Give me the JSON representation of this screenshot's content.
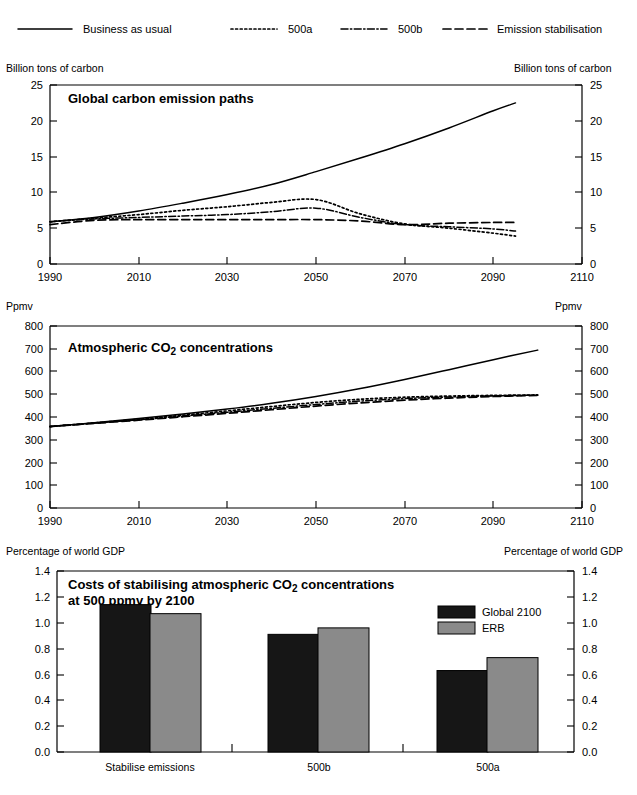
{
  "legend": {
    "items": [
      {
        "label": "Business as usual",
        "style": "solid",
        "key": "bau"
      },
      {
        "label": "500a",
        "style": "dotted",
        "key": "s500a"
      },
      {
        "label": "500b",
        "style": "dash-dot",
        "key": "s500b"
      },
      {
        "label": "Emission stabilisation",
        "style": "dashed",
        "key": "stab"
      }
    ]
  },
  "chart_data": [
    {
      "type": "line",
      "title": "Global carbon emission paths",
      "xlabel": "",
      "ylabel": "Billion tons of carbon",
      "ylabel_right": "Billion tons of carbon",
      "xlim": [
        1990,
        2110
      ],
      "ylim": [
        0,
        25
      ],
      "xticks": [
        1990,
        2010,
        2030,
        2050,
        2070,
        2090,
        2110
      ],
      "yticks": [
        0,
        5,
        10,
        15,
        20,
        25
      ],
      "grid": false,
      "legend_position": "top",
      "x": [
        1990,
        2000,
        2010,
        2020,
        2030,
        2040,
        2050,
        2060,
        2070,
        2080,
        2090,
        2095
      ],
      "series": [
        {
          "name": "Business as usual",
          "values": [
            5.9,
            6.5,
            7.4,
            8.5,
            9.7,
            11.1,
            12.9,
            14.8,
            16.8,
            19.0,
            21.4,
            22.5
          ]
        },
        {
          "name": "500a",
          "values": [
            5.9,
            6.4,
            6.9,
            7.5,
            8.0,
            8.6,
            9.0,
            7.0,
            5.6,
            5.0,
            4.3,
            3.9
          ]
        },
        {
          "name": "500b",
          "values": [
            5.9,
            6.3,
            6.5,
            6.7,
            6.9,
            7.3,
            7.8,
            6.5,
            5.5,
            5.2,
            4.9,
            4.6
          ]
        },
        {
          "name": "Emission stabilisation",
          "values": [
            5.5,
            6.1,
            6.2,
            6.2,
            6.2,
            6.2,
            6.2,
            6.0,
            5.5,
            5.7,
            5.8,
            5.8
          ]
        }
      ]
    },
    {
      "type": "line",
      "title": "Atmospheric CO2 concentrations",
      "title_html": "Atmospheric CO₂ concentrations",
      "xlabel": "",
      "ylabel": "Ppmv",
      "ylabel_right": "Ppmv",
      "xlim": [
        1990,
        2110
      ],
      "ylim": [
        0,
        800
      ],
      "xticks": [
        1990,
        2010,
        2030,
        2050,
        2070,
        2090,
        2110
      ],
      "yticks": [
        0,
        100,
        200,
        300,
        400,
        500,
        600,
        700,
        800
      ],
      "grid": false,
      "legend_position": "top",
      "x": [
        1990,
        2000,
        2010,
        2020,
        2030,
        2040,
        2050,
        2060,
        2070,
        2080,
        2090,
        2100
      ],
      "series": [
        {
          "name": "Business as usual",
          "values": [
            358,
            375,
            393,
            413,
            435,
            460,
            490,
            525,
            565,
            608,
            652,
            694
          ]
        },
        {
          "name": "500a",
          "values": [
            358,
            374,
            390,
            408,
            427,
            446,
            464,
            478,
            487,
            492,
            495,
            497
          ]
        },
        {
          "name": "500b",
          "values": [
            358,
            373,
            388,
            404,
            421,
            438,
            455,
            470,
            481,
            488,
            493,
            496
          ]
        },
        {
          "name": "Emission stabilisation",
          "values": [
            358,
            372,
            386,
            401,
            416,
            432,
            448,
            462,
            474,
            483,
            490,
            495
          ]
        }
      ]
    },
    {
      "type": "bar",
      "title": "Costs of stabilising atmospheric CO2 concentrations at 500 ppmv by 2100",
      "title_line1": "Costs of stabilising atmospheric CO₂ concentrations",
      "title_line2": "at 500 ppmv by 2100",
      "xlabel": "",
      "ylabel": "Percentage of world GDP",
      "ylabel_right": "Percentage of world GDP",
      "categories": [
        "Stabilise emissions",
        "500b",
        "500a"
      ],
      "yticks": [
        0.0,
        0.2,
        0.4,
        0.6,
        0.8,
        1.0,
        1.2,
        1.4
      ],
      "ytick_labels": [
        "0.0",
        "0.2",
        "0.4",
        "0.6",
        "0.8",
        "1.0",
        "1.2",
        "1.4"
      ],
      "ylim": [
        0,
        1.4
      ],
      "grid": false,
      "legend_position": "inside-right",
      "series": [
        {
          "name": "Global 2100",
          "values": [
            1.14,
            0.91,
            0.63
          ],
          "color": "#161616"
        },
        {
          "name": "ERB",
          "values": [
            1.07,
            0.96,
            0.73
          ],
          "color": "#8a8a8a"
        }
      ]
    }
  ]
}
